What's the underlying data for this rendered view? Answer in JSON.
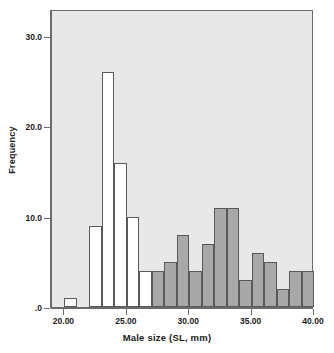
{
  "chart_data": {
    "type": "bar",
    "subtype": "overlaid-histogram",
    "title": "",
    "xlabel": "Male size (SL, mm)",
    "ylabel": "Frequency",
    "xlim": [
      19.0,
      40.0
    ],
    "ylim": [
      0,
      33.0
    ],
    "grid": false,
    "legend": "none",
    "bin_width": 1,
    "plot_background": "#e8e8e8",
    "x_ticks": [
      {
        "value": 20,
        "label": "20.00"
      },
      {
        "value": 25,
        "label": "25.00"
      },
      {
        "value": 30,
        "label": "30.00"
      },
      {
        "value": 35,
        "label": "35.00"
      },
      {
        "value": 40,
        "label": "40.00"
      }
    ],
    "y_ticks": [
      {
        "value": 30,
        "label": "30.0"
      },
      {
        "value": 20,
        "label": "20.0"
      },
      {
        "value": 10,
        "label": "10.0"
      },
      {
        "value": 0,
        "label": ".0"
      }
    ],
    "series": [
      {
        "name": "white-series",
        "color": "#ffffff",
        "edge_color": "#595959",
        "bins": [
          {
            "x0": 20.0,
            "x1": 21.0,
            "value": 1
          },
          {
            "x0": 22.0,
            "x1": 23.0,
            "value": 9
          },
          {
            "x0": 23.0,
            "x1": 24.0,
            "value": 26
          },
          {
            "x0": 24.0,
            "x1": 25.0,
            "value": 16
          },
          {
            "x0": 25.0,
            "x1": 26.0,
            "value": 10
          },
          {
            "x0": 26.0,
            "x1": 27.0,
            "value": 4
          }
        ]
      },
      {
        "name": "gray-series",
        "color": "#a8a8a8",
        "edge_color": "#595959",
        "bins": [
          {
            "x0": 23.0,
            "x1": 24.0,
            "value": 1
          },
          {
            "x0": 25.0,
            "x1": 26.0,
            "value": 1
          },
          {
            "x0": 26.0,
            "x1": 27.0,
            "value": 2
          },
          {
            "x0": 27.0,
            "x1": 28.0,
            "value": 4
          },
          {
            "x0": 28.0,
            "x1": 29.0,
            "value": 5
          },
          {
            "x0": 29.0,
            "x1": 30.0,
            "value": 8
          },
          {
            "x0": 30.0,
            "x1": 31.0,
            "value": 4
          },
          {
            "x0": 31.0,
            "x1": 32.0,
            "value": 7
          },
          {
            "x0": 32.0,
            "x1": 33.0,
            "value": 11
          },
          {
            "x0": 33.0,
            "x1": 34.0,
            "value": 11
          },
          {
            "x0": 34.0,
            "x1": 35.0,
            "value": 3
          },
          {
            "x0": 35.0,
            "x1": 36.0,
            "value": 6
          },
          {
            "x0": 36.0,
            "x1": 37.0,
            "value": 5
          },
          {
            "x0": 37.0,
            "x1": 38.0,
            "value": 2
          },
          {
            "x0": 38.0,
            "x1": 39.0,
            "value": 4
          },
          {
            "x0": 39.0,
            "x1": 40.0,
            "value": 4
          }
        ]
      }
    ]
  }
}
